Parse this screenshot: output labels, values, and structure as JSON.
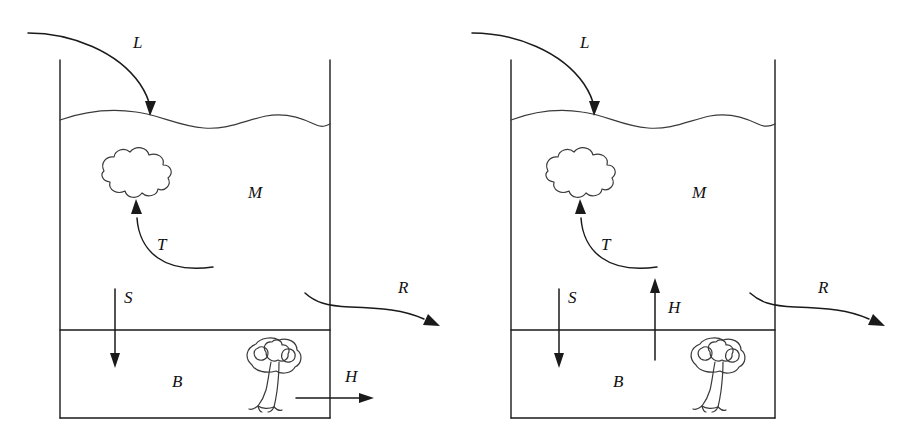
{
  "figure": {
    "type": "schematic-diagram",
    "background_color": "#ffffff",
    "line_color": "#1a1a1a",
    "width": 919,
    "height": 434,
    "panel_count": 2
  },
  "panels": [
    {
      "id": "left-panel",
      "name": "left-reservoir-diagram",
      "tank": {
        "left_wall_x": 60,
        "right_wall_x": 330,
        "top_y": 60,
        "bottom_y": 418,
        "divider_y": 330,
        "water_surface_y": 120
      },
      "pools": [
        {
          "key": "M",
          "label": "M",
          "x": 248,
          "y": 198
        },
        {
          "key": "B",
          "label": "B",
          "x": 172,
          "y": 387
        }
      ],
      "fluxes": [
        {
          "key": "L",
          "label": "L",
          "x": 133,
          "y": 48,
          "direction": "inward-down",
          "shape": "curved"
        },
        {
          "key": "T",
          "label": "T",
          "x": 157,
          "y": 250,
          "direction": "upward-to-cloud",
          "shape": "curved"
        },
        {
          "key": "S",
          "label": "S",
          "x": 124,
          "y": 303,
          "direction": "down",
          "shape": "straight"
        },
        {
          "key": "R",
          "label": "R",
          "x": 398,
          "y": 293,
          "direction": "outward-right",
          "shape": "curved"
        },
        {
          "key": "H",
          "label": "H",
          "x": 345,
          "y": 382,
          "direction": "right",
          "shape": "straight"
        }
      ],
      "objects": [
        {
          "key": "cloud",
          "name": "cloud-blob",
          "cx": 130,
          "cy": 182
        },
        {
          "key": "tree",
          "name": "tree",
          "cx": 270,
          "cy": 378
        }
      ]
    },
    {
      "id": "right-panel",
      "name": "right-reservoir-diagram",
      "tank": {
        "left_wall_x": 511,
        "right_wall_x": 775,
        "top_y": 60,
        "bottom_y": 418,
        "divider_y": 330,
        "water_surface_y": 120
      },
      "pools": [
        {
          "key": "M",
          "label": "M",
          "x": 692,
          "y": 198
        },
        {
          "key": "B",
          "label": "B",
          "x": 613,
          "y": 387
        }
      ],
      "fluxes": [
        {
          "key": "L",
          "label": "L",
          "x": 580,
          "y": 48,
          "direction": "inward-down",
          "shape": "curved"
        },
        {
          "key": "T",
          "label": "T",
          "x": 601,
          "y": 250,
          "direction": "upward-to-cloud",
          "shape": "curved"
        },
        {
          "key": "S",
          "label": "S",
          "x": 568,
          "y": 303,
          "direction": "down",
          "shape": "straight"
        },
        {
          "key": "R",
          "label": "R",
          "x": 818,
          "y": 293,
          "direction": "outward-right",
          "shape": "curved"
        },
        {
          "key": "H",
          "label": "H",
          "x": 668,
          "y": 313,
          "direction": "up",
          "shape": "straight"
        }
      ],
      "objects": [
        {
          "key": "cloud",
          "name": "cloud-blob",
          "cx": 574,
          "cy": 182
        },
        {
          "key": "tree",
          "name": "tree",
          "cx": 714,
          "cy": 378
        }
      ]
    }
  ]
}
